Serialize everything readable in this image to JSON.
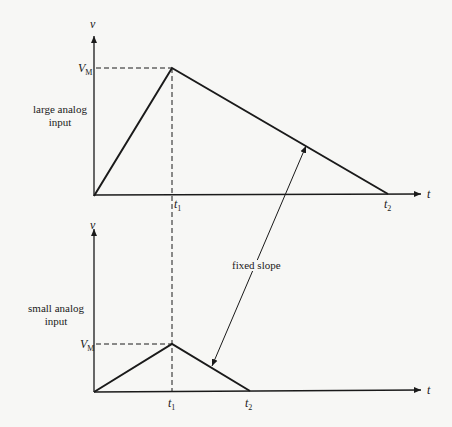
{
  "figure": {
    "line_color": "#1a1a1a",
    "background": "#f7f7f5"
  },
  "top_plot": {
    "side_label_line1": "large analog",
    "side_label_line2": "input",
    "y_axis_label": "v",
    "x_axis_label": "t",
    "peak_label": "V",
    "peak_label_sub": "M",
    "t1_label": "t",
    "t1_sub": "1",
    "t2_label": "t",
    "t2_sub": "2",
    "points": {
      "origin": [
        94,
        196
      ],
      "peak": [
        172,
        68
      ],
      "t2": [
        388,
        194
      ]
    }
  },
  "bottom_plot": {
    "side_label_line1": "small analog",
    "side_label_line2": "input",
    "y_axis_label": "v",
    "x_axis_label": "t",
    "peak_label": "V",
    "peak_label_sub": "M",
    "t1_label": "t",
    "t1_sub": "1",
    "t2_label": "t",
    "t2_sub": "2",
    "points": {
      "origin": [
        94,
        392
      ],
      "peak": [
        172,
        344
      ],
      "t2": [
        250,
        391
      ]
    }
  },
  "annotation": {
    "text": "fixed slope"
  }
}
